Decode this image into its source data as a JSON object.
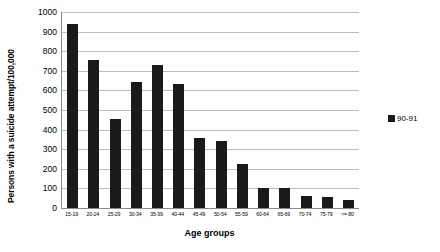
{
  "chart_data": {
    "type": "bar",
    "title": "",
    "xlabel": "Age groups",
    "ylabel": "Persons with a suicide attempt/100,000",
    "ylim": [
      0,
      1000
    ],
    "ytick_step": 100,
    "yticks": [
      1000,
      900,
      800,
      700,
      600,
      500,
      400,
      300,
      200,
      100,
      0
    ],
    "grid": true,
    "legend_position": "right",
    "bar_color": "#1a1a1a",
    "gridline_color": "#bdbdbd",
    "axis_color": "#8a8a8a",
    "background": "#ffffff",
    "categories": [
      "15-19",
      "20-24",
      "25-29",
      "30-34",
      "35-39",
      "40-44",
      "45-49",
      "50-54",
      "55-59",
      "60-64",
      "65-69",
      "70-74",
      "75-79",
      ">= 80"
    ],
    "series": [
      {
        "name": "90-91",
        "values": [
          940,
          755,
          455,
          645,
          730,
          635,
          355,
          340,
          225,
          100,
          100,
          60,
          55,
          40
        ]
      }
    ],
    "legend": [
      "90-91"
    ]
  }
}
